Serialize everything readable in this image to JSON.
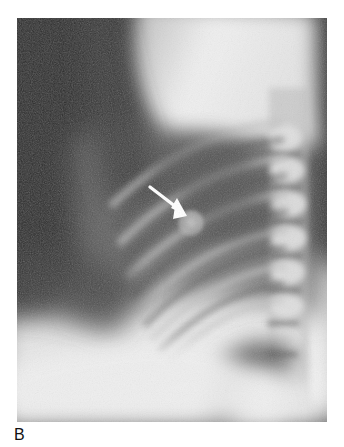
{
  "figure": {
    "panel_label": "B",
    "modality": "chest-radiograph",
    "projection": "lateral",
    "caption_visible": false
  },
  "image": {
    "name": "lateral-chest-radiograph",
    "alt_text": "Lateral chest radiograph",
    "frame": {
      "x": 17,
      "y": 18,
      "width": 310,
      "height": 404
    }
  },
  "annotations": {
    "arrow": {
      "name": "pointer-arrow",
      "color": "#ffffff",
      "tail": {
        "x": 133,
        "y": 169
      },
      "tip": {
        "x": 168,
        "y": 196
      },
      "direction": "down-right"
    },
    "finding": {
      "name": "pulmonary-nodule",
      "label": "nodule",
      "center": {
        "x": 174,
        "y": 205
      },
      "radius": 11,
      "appearance": "round well-circumscribed opacity"
    }
  },
  "anatomy": [
    {
      "name": "background-air",
      "region": "upper-left",
      "tone": "#2b2b2b"
    },
    {
      "name": "soft-tissue-shoulder",
      "region": "upper-center",
      "tone": "#ececec"
    },
    {
      "name": "thoracic-spine",
      "region": "right-column",
      "tone": "#d8d8d8"
    },
    {
      "name": "posterior-ribs",
      "region": "mid-left",
      "tone": "#9a9a9a"
    },
    {
      "name": "diaphragm-heart",
      "region": "lower-center",
      "tone": "#e0e0e0"
    },
    {
      "name": "retrosternal-lung",
      "region": "mid-center",
      "tone": "#6a6a6a"
    }
  ],
  "colors": {
    "page_background": "#ffffff",
    "film_dark": "#2b2b2b",
    "film_bright": "#f2f2f2",
    "label_text": "#111111",
    "annotation": "#ffffff"
  }
}
